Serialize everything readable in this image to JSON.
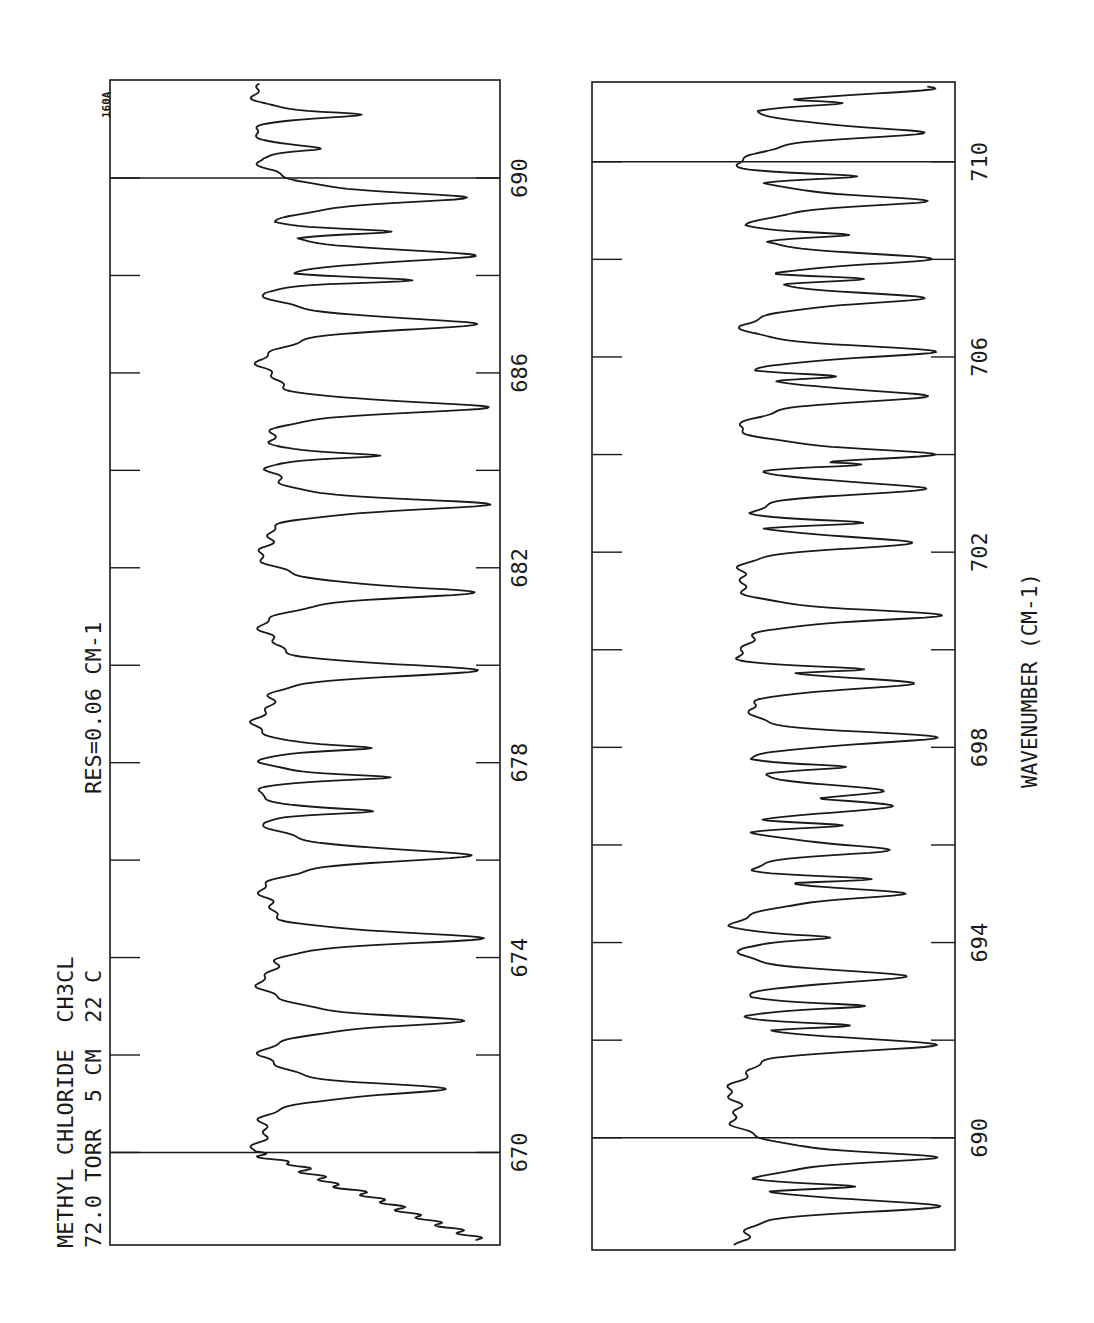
{
  "chart_data": [
    {
      "type": "line",
      "panel": "top",
      "title": "METHYL CHLORIDE  CH3CL",
      "subtitle": "72.0 TORR  5 CM  22 C",
      "annotation": "RES=0.06 CM-1",
      "corner_label": "160A",
      "xlabel": "",
      "ylabel": "",
      "orientation": "rotated-90",
      "xlim": [
        668.5,
        691.8
      ],
      "ticks": [
        670,
        672,
        674,
        676,
        678,
        680,
        682,
        684,
        686,
        688,
        690
      ],
      "tick_labels": [
        "670",
        "674",
        "678",
        "682",
        "686",
        "690"
      ],
      "grid_lines": [
        670,
        690
      ],
      "absorption_peaks": [
        {
          "x": 671.3,
          "depth": 0.8
        },
        {
          "x": 672.7,
          "depth": 0.87
        },
        {
          "x": 674.4,
          "depth": 0.91
        },
        {
          "x": 676.1,
          "depth": 0.93
        },
        {
          "x": 677.7,
          "depth": 0.55
        },
        {
          "x": 678.3,
          "depth": 0.5
        },
        {
          "x": 677.0,
          "depth": 0.48
        },
        {
          "x": 679.9,
          "depth": 0.91
        },
        {
          "x": 681.5,
          "depth": 0.93
        },
        {
          "x": 683.3,
          "depth": 0.94
        },
        {
          "x": 684.3,
          "depth": 0.55
        },
        {
          "x": 685.3,
          "depth": 0.94
        },
        {
          "x": 687.0,
          "depth": 0.95
        },
        {
          "x": 687.9,
          "depth": 0.62
        },
        {
          "x": 688.4,
          "depth": 0.93
        },
        {
          "x": 688.9,
          "depth": 0.6
        },
        {
          "x": 689.6,
          "depth": 0.88
        },
        {
          "x": 690.6,
          "depth": 0.25
        },
        {
          "x": 691.3,
          "depth": 0.42
        }
      ]
    },
    {
      "type": "line",
      "panel": "bottom",
      "xlabel": "WAVENUMBER (CM-1)",
      "ylabel": "",
      "orientation": "rotated-90",
      "xlim": [
        688.2,
        711.8
      ],
      "ticks": [
        690,
        692,
        694,
        696,
        698,
        700,
        702,
        704,
        706,
        708,
        710
      ],
      "tick_labels": [
        "690",
        "694",
        "698",
        "702",
        "706",
        "710"
      ],
      "grid_lines": [
        690,
        710
      ],
      "absorption_peaks": [
        {
          "x": 688.6,
          "depth": 0.93
        },
        {
          "x": 689.0,
          "depth": 0.58
        },
        {
          "x": 689.6,
          "depth": 0.94
        },
        {
          "x": 691.9,
          "depth": 0.93
        },
        {
          "x": 692.3,
          "depth": 0.55
        },
        {
          "x": 692.7,
          "depth": 0.6
        },
        {
          "x": 693.3,
          "depth": 0.78
        },
        {
          "x": 694.1,
          "depth": 0.45
        },
        {
          "x": 695.0,
          "depth": 0.8
        },
        {
          "x": 695.3,
          "depth": 0.6
        },
        {
          "x": 695.9,
          "depth": 0.71
        },
        {
          "x": 696.4,
          "depth": 0.52
        },
        {
          "x": 696.8,
          "depth": 0.73
        },
        {
          "x": 697.1,
          "depth": 0.73
        },
        {
          "x": 697.6,
          "depth": 0.55
        },
        {
          "x": 698.2,
          "depth": 0.93
        },
        {
          "x": 699.3,
          "depth": 0.82
        },
        {
          "x": 699.6,
          "depth": 0.6
        },
        {
          "x": 700.7,
          "depth": 0.92
        },
        {
          "x": 702.2,
          "depth": 0.81
        },
        {
          "x": 702.6,
          "depth": 0.6
        },
        {
          "x": 703.3,
          "depth": 0.9
        },
        {
          "x": 703.8,
          "depth": 0.62
        },
        {
          "x": 704.0,
          "depth": 0.9
        },
        {
          "x": 705.2,
          "depth": 0.93
        },
        {
          "x": 705.6,
          "depth": 0.45
        },
        {
          "x": 706.1,
          "depth": 0.91
        },
        {
          "x": 707.2,
          "depth": 0.9
        },
        {
          "x": 707.6,
          "depth": 0.58
        },
        {
          "x": 708.0,
          "depth": 0.92
        },
        {
          "x": 708.5,
          "depth": 0.58
        },
        {
          "x": 709.2,
          "depth": 0.9
        },
        {
          "x": 709.7,
          "depth": 0.55
        },
        {
          "x": 710.6,
          "depth": 0.9
        },
        {
          "x": 711.2,
          "depth": 0.55
        },
        {
          "x": 711.5,
          "depth": 0.92
        }
      ]
    }
  ],
  "labels": {
    "title_line1": "METHYL CHLORIDE  CH3CL",
    "title_line2": "72.0 TORR  5 CM  22 C",
    "resolution": "RES=0.06 CM-1",
    "corner": "160A",
    "axis_label": "WAVENUMBER (CM-1)"
  },
  "panels": {
    "top": {
      "frame": {
        "left": 110,
        "right": 500,
        "top": 80,
        "bottom": 1245
      },
      "wn_bottom": 668.1,
      "wn_top": 692.0,
      "px_per_wn": 48.72,
      "baseline_x": 255,
      "floor_x": 498,
      "tick_label_x": 527,
      "tick_labels": [
        {
          "wn": 670,
          "text": "670"
        },
        {
          "wn": 674,
          "text": "674"
        },
        {
          "wn": 678,
          "text": "678"
        },
        {
          "wn": 682,
          "text": "682"
        },
        {
          "wn": 686,
          "text": "686"
        },
        {
          "wn": 690,
          "text": "690"
        }
      ]
    },
    "bottom": {
      "frame": {
        "left": 592,
        "right": 955,
        "top": 82,
        "bottom": 1250
      },
      "wn_bottom": 687.7,
      "wn_top": 711.6,
      "px_per_wn": 48.8,
      "baseline_x": 728,
      "floor_x": 953,
      "tick_label_x": 987,
      "tick_labels": [
        {
          "wn": 690,
          "text": "690"
        },
        {
          "wn": 694,
          "text": "694"
        },
        {
          "wn": 698,
          "text": "698"
        },
        {
          "wn": 702,
          "text": "702"
        },
        {
          "wn": 706,
          "text": "706"
        },
        {
          "wn": 710,
          "text": "710"
        }
      ]
    }
  }
}
